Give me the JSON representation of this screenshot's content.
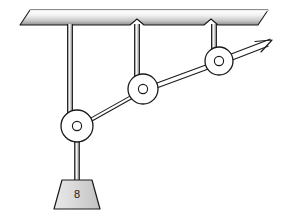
{
  "figure": {
    "name": "pulley-system-diagram",
    "type": "mechanics-diagram",
    "background_color": "#ffffff",
    "stroke_color": "#1a1a1a",
    "canvas": {
      "width": 281,
      "height": 218
    }
  },
  "ceiling": {
    "name": "ceiling-plate",
    "gradient_top_color": "#ffffff",
    "gradient_bottom_color": "#8f8f8f",
    "edge_color": "#1a1a1a",
    "notch_count": 2,
    "top_left_x": 30,
    "top_right_x": 268,
    "top_y": 10,
    "bottom_left_x": 20,
    "bottom_right_x": 258,
    "bottom_y": 25
  },
  "supports": [
    {
      "name": "support-rod-left",
      "x": 70,
      "top_y": 24,
      "bottom_y": 126,
      "width": 5
    },
    {
      "name": "support-rod-middle",
      "x": 137,
      "top_y": 24,
      "bottom_y": 89,
      "width": 5
    },
    {
      "name": "support-rod-right",
      "x": 214,
      "top_y": 24,
      "bottom_y": 61,
      "width": 5
    }
  ],
  "pulleys": [
    {
      "name": "pulley-lower-left",
      "cx": 77,
      "cy": 126,
      "r": 16,
      "hub_r": 4.5,
      "face_color": "#ffffff",
      "hub_color": "#ffffff"
    },
    {
      "name": "pulley-middle",
      "cx": 143,
      "cy": 89,
      "r": 15,
      "hub_r": 4.5,
      "face_color": "#ffffff",
      "hub_color": "#ffffff"
    },
    {
      "name": "pulley-upper-right",
      "cx": 219,
      "cy": 61,
      "r": 14,
      "hub_r": 4.5,
      "face_color": "#ffffff",
      "hub_color": "#ffffff"
    }
  ],
  "ropes": [
    {
      "name": "rope-segment-lower-left-to-middle",
      "x1": 77,
      "y1": 126,
      "x2": 143,
      "y2": 89,
      "style": "double-line"
    },
    {
      "name": "rope-segment-middle-to-upper-right",
      "x1": 143,
      "y1": 89,
      "x2": 219,
      "y2": 61,
      "style": "double-line"
    },
    {
      "name": "rope-segment-pull-end",
      "x1": 219,
      "y1": 61,
      "x2": 268,
      "y2": 42,
      "style": "double-line-with-arrow"
    },
    {
      "name": "rope-segment-weight-hanger",
      "x1": 77,
      "y1": 126,
      "x2": 77,
      "y2": 180,
      "style": "double-line"
    }
  ],
  "arrow": {
    "name": "pull-force-arrow",
    "tip_x": 272,
    "tip_y": 41,
    "direction": "up-right",
    "head_length": 13,
    "head_angle_deg": 22
  },
  "weight": {
    "name": "hanging-weight-block",
    "label": "8",
    "shape": "trapezoid",
    "top_left_x": 62,
    "top_right_x": 92,
    "top_y": 180,
    "bottom_left_x": 54,
    "bottom_right_x": 100,
    "bottom_y": 209,
    "fill_color": "#d8d8d8",
    "edge_color": "#1a1a1a",
    "label_x": 77,
    "label_y": 194
  }
}
